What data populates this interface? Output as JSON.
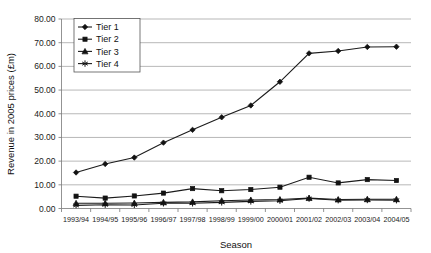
{
  "chart_data": {
    "type": "line",
    "title": "",
    "xlabel": "Season",
    "ylabel": "Revenue in 2005 prices (£m)",
    "categories": [
      "1993/94",
      "1994/95",
      "1995/96",
      "1996/97",
      "1997/98",
      "1998/99",
      "1999/00",
      "2000/01",
      "2001/02",
      "2002/03",
      "2003/04",
      "2004/05"
    ],
    "ylim": [
      0,
      80
    ],
    "ytick_step": 10,
    "ytick_labels": [
      "0.00",
      "10.00",
      "20.00",
      "30.00",
      "40.00",
      "50.00",
      "60.00",
      "70.00",
      "80.00"
    ],
    "ytick_values": [
      0,
      10,
      20,
      30,
      40,
      50,
      60,
      70,
      80
    ],
    "grid": "horizontal",
    "legend_position": "top-left-inside",
    "series": [
      {
        "name": "Tier 1",
        "marker": "diamond",
        "values": [
          15.2,
          18.8,
          21.5,
          27.8,
          33.2,
          38.5,
          43.5,
          53.5,
          65.5,
          66.5,
          68.2,
          68.3
        ]
      },
      {
        "name": "Tier 2",
        "marker": "square",
        "values": [
          5.2,
          4.4,
          5.3,
          6.5,
          8.4,
          7.5,
          8.0,
          9.0,
          13.2,
          10.8,
          12.2,
          11.8
        ]
      },
      {
        "name": "Tier 3",
        "marker": "triangle",
        "values": [
          2.2,
          2.2,
          2.3,
          2.6,
          2.8,
          3.3,
          3.6,
          3.8,
          4.4,
          3.8,
          3.9,
          3.9
        ]
      },
      {
        "name": "Tier 4",
        "marker": "star",
        "values": [
          1.3,
          1.6,
          1.5,
          2.2,
          2.2,
          2.6,
          3.0,
          3.3,
          4.2,
          3.5,
          3.6,
          3.5
        ]
      }
    ],
    "colors": {
      "line": "#1b1b1b",
      "marker": "#121212",
      "grid": "#9a9a9a",
      "axis": "#777777",
      "background": "#ffffff"
    }
  }
}
